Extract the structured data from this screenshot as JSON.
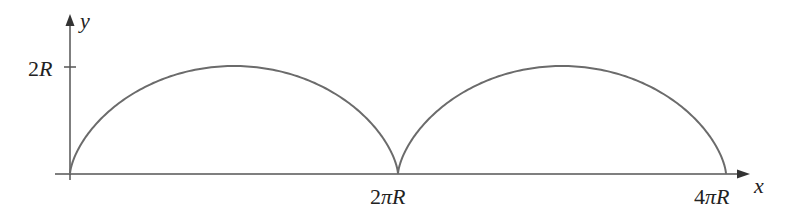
{
  "chart_data": {
    "type": "line",
    "title": "",
    "xlabel": "x",
    "ylabel": "y",
    "x_ticks": [
      "2πR",
      "4πR"
    ],
    "y_ticks": [
      "2R"
    ],
    "x_range": [
      0,
      "4πR"
    ],
    "y_range": [
      0,
      "2R"
    ],
    "series": [
      {
        "name": "cycloid",
        "arches": 2,
        "peak_y": "2R",
        "peaks_x": [
          "πR",
          "3πR"
        ],
        "cusps_x": [
          0,
          "2πR",
          "4πR"
        ]
      }
    ],
    "grid": false,
    "legend": null
  },
  "labels": {
    "y_axis": "y",
    "x_axis": "x",
    "y_tick": "2R",
    "x_tick_1": "2πR",
    "x_tick_2": "4πR"
  },
  "colors": {
    "axis": "#444444",
    "curve": "#6b6b6b",
    "text": "#222222"
  }
}
